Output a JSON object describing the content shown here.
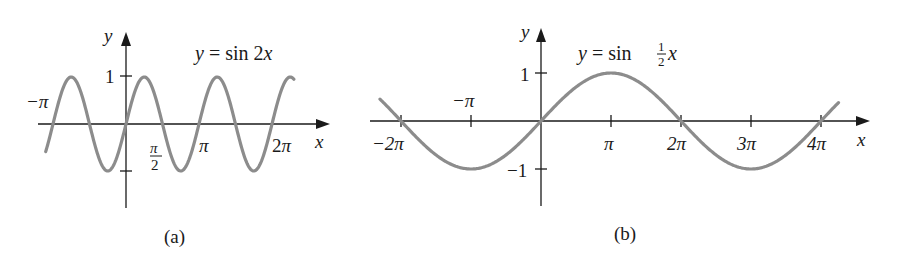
{
  "chart_data": [
    {
      "type": "line",
      "panel": "(a)",
      "title": "y = sin 2x",
      "equation": "y = sin 2x",
      "xlabel": "x",
      "ylabel": "y",
      "x_ticks": [
        "−π",
        "π/2",
        "π",
        "2π"
      ],
      "y_ticks": [
        "1",
        "−1"
      ],
      "xlim": [
        -1.15,
        2.35
      ],
      "xlim_units": "multiples of π",
      "ylim": [
        -1.9,
        1.8
      ],
      "series": [
        {
          "name": "sin 2x",
          "function": "sin(2x)",
          "x_range_pi": [
            -1.1,
            2.3
          ]
        }
      ],
      "grid": false,
      "legend": "none"
    },
    {
      "type": "line",
      "panel": "(b)",
      "title": "y = sin ½x",
      "equation": "y = sin (1/2)x",
      "xlabel": "x",
      "ylabel": "y",
      "x_ticks": [
        "−2π",
        "−π",
        "π",
        "2π",
        "3π",
        "4π"
      ],
      "y_ticks": [
        "1",
        "−1"
      ],
      "xlim": [
        -2.4,
        4.8
      ],
      "xlim_units": "multiples of π",
      "ylim": [
        -1.9,
        1.8
      ],
      "series": [
        {
          "name": "sin x/2",
          "function": "sin(x/2)",
          "x_range_pi": [
            -2.3,
            4.25
          ]
        }
      ],
      "grid": false,
      "legend": "none"
    }
  ],
  "panel_a": {
    "caption": "(a)",
    "eq_y": "y",
    "eq_eq": "=",
    "eq_fn": "sin 2",
    "eq_x": "x",
    "axis_x": "x",
    "axis_y": "y",
    "tick_1": "1",
    "tick_neg_pi": "−π",
    "tick_pi_num": "π",
    "tick_pi_den": "2",
    "tick_pi": "π",
    "tick_2pi_coef": "2",
    "tick_2pi_pi": "π"
  },
  "panel_b": {
    "caption": "(b)",
    "eq_y": "y",
    "eq_eq": "=",
    "eq_fn": "sin",
    "eq_num": "1",
    "eq_den": "2",
    "eq_x": "x",
    "axis_x": "x",
    "axis_y": "y",
    "tick_1": "1",
    "tick_m1": "−1",
    "tick_neg2pi": "−2π",
    "tick_negpi": "−π",
    "tick_pi": "π",
    "tick_2pi": "2π",
    "tick_3pi": "3π",
    "tick_4pi": "4π"
  },
  "colors": {
    "curve": "#8c8c8c",
    "axis": "#1a1a1a",
    "background": "#ffffff"
  }
}
